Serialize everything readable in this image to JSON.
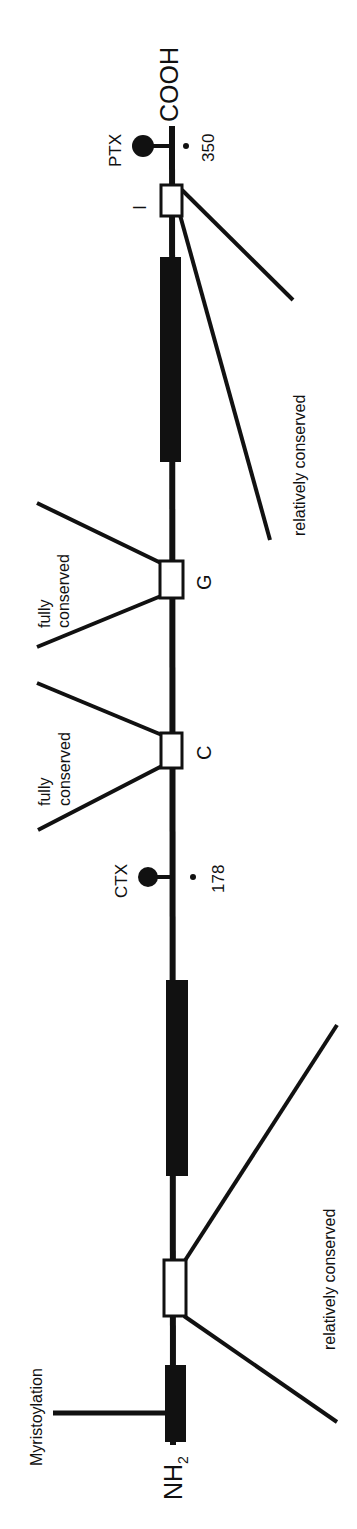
{
  "diagram": {
    "termini": {
      "c_terminus": "COOH",
      "n_terminus_main": "NH",
      "n_terminus_sub": "2"
    },
    "modifications": [
      {
        "label": "PTX",
        "residue": "350"
      },
      {
        "label": "CTX",
        "residue": "178"
      }
    ],
    "regions": {
      "I": "I",
      "G": "G",
      "C": "C"
    },
    "annotations": {
      "relatively_conserved_top": "relatively conserved",
      "relatively_conserved_bottom": "relatively conserved",
      "fully_conserved_g_line1": "fully",
      "fully_conserved_g_line2": "conserved",
      "fully_conserved_c_line1": "fully",
      "fully_conserved_c_line2": "conserved",
      "myristoylation": "Myristoylation"
    },
    "colors": {
      "ink": "#111111",
      "background": "#ffffff"
    }
  }
}
